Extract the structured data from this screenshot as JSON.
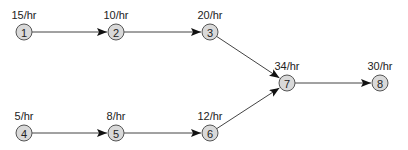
{
  "diagram": {
    "type": "flow-network",
    "nodes": [
      {
        "id": "1",
        "label": "1",
        "rate": "15/hr",
        "x": 24,
        "y": 32
      },
      {
        "id": "2",
        "label": "2",
        "rate": "10/hr",
        "x": 116,
        "y": 32
      },
      {
        "id": "3",
        "label": "3",
        "rate": "20/hr",
        "x": 210,
        "y": 32
      },
      {
        "id": "4",
        "label": "4",
        "rate": "5/hr",
        "x": 24,
        "y": 133
      },
      {
        "id": "5",
        "label": "5",
        "rate": "8/hr",
        "x": 116,
        "y": 133
      },
      {
        "id": "6",
        "label": "6",
        "rate": "12/hr",
        "x": 210,
        "y": 133
      },
      {
        "id": "7",
        "label": "7",
        "rate": "34/hr",
        "x": 287,
        "y": 83
      },
      {
        "id": "8",
        "label": "8",
        "rate": "30/hr",
        "x": 380,
        "y": 83
      }
    ],
    "edges": [
      {
        "from": "1",
        "to": "2"
      },
      {
        "from": "2",
        "to": "3"
      },
      {
        "from": "3",
        "to": "7"
      },
      {
        "from": "4",
        "to": "5"
      },
      {
        "from": "5",
        "to": "6"
      },
      {
        "from": "6",
        "to": "7"
      },
      {
        "from": "7",
        "to": "8"
      }
    ],
    "colors": {
      "node_fill": "#d9d9d9",
      "node_stroke": "#555555",
      "edge": "#444444",
      "text": "#222222"
    }
  }
}
